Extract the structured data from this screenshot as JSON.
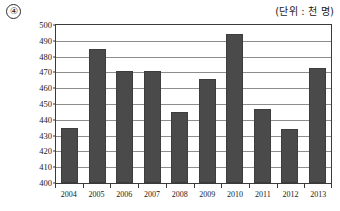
{
  "header": {
    "item_number": "④",
    "unit_label": "(단위 : 천 명)"
  },
  "chart_data": {
    "type": "bar",
    "title": "",
    "subtitle": "",
    "xlabel": "",
    "ylabel": "",
    "unit_note": "(단위 : 천 명)",
    "categories": [
      "2004",
      "2005",
      "2006",
      "2007",
      "2008",
      "2009",
      "2010",
      "2011",
      "2012",
      "2013"
    ],
    "values": [
      435,
      485,
      471,
      471,
      445,
      466,
      494,
      447,
      434,
      473
    ],
    "series": [
      {
        "name": "",
        "values": [
          435,
          485,
          471,
          471,
          445,
          466,
          494,
          447,
          434,
          473
        ]
      }
    ],
    "ylim": [
      400,
      500
    ],
    "ytick_step": 10,
    "yticks": [
      400,
      410,
      420,
      430,
      440,
      450,
      460,
      470,
      480,
      490,
      500
    ],
    "ytick_labels": [
      "400",
      "410",
      "420",
      "430",
      "440",
      "450",
      "460",
      "470",
      "480",
      "490",
      "500"
    ],
    "grid": true,
    "grid_axis": "y",
    "legend": false,
    "legend_position": "none",
    "bar_color": "#4a4a4a",
    "gridline_color": "#8d8d8d",
    "axis_color": "#3a3a3a",
    "background_color": "#ffffff"
  }
}
